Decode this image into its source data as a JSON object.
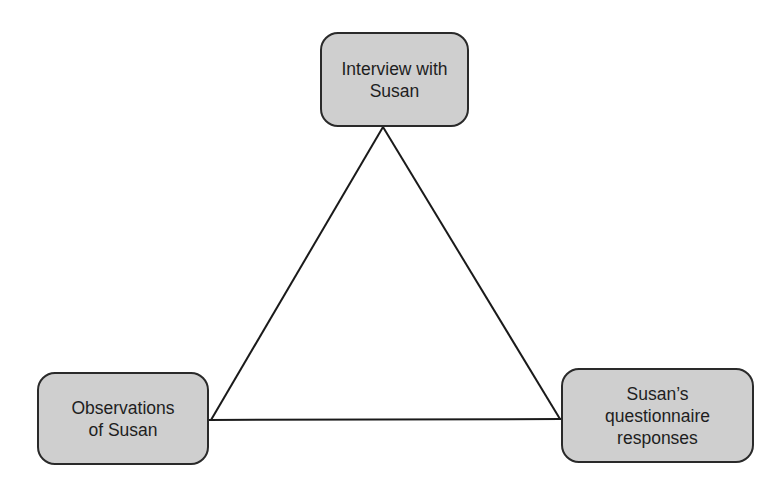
{
  "diagram": {
    "type": "triangle-triangulation",
    "nodes": [
      {
        "id": "top",
        "label": "Interview with\nSusan"
      },
      {
        "id": "left",
        "label": "Observations\nof Susan"
      },
      {
        "id": "right",
        "label": "Susan’s\nquestionnaire\nresponses"
      }
    ],
    "edges": [
      {
        "from": "top",
        "to": "left"
      },
      {
        "from": "top",
        "to": "right"
      },
      {
        "from": "left",
        "to": "right"
      }
    ],
    "colors": {
      "node_fill": "#cfcfcf",
      "node_border": "#2a2a2a",
      "line": "#1a1a1a",
      "background": "#ffffff"
    }
  }
}
